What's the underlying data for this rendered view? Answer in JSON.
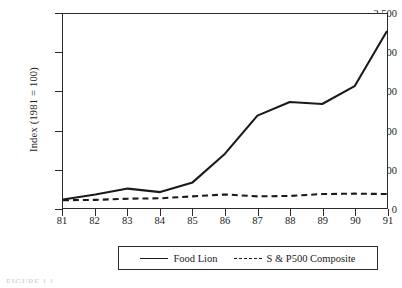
{
  "figure": {
    "caption_partial": "FIGURE 1.1"
  },
  "chart_data": {
    "type": "line",
    "title": "",
    "xlabel": "",
    "ylabel": "Index (1981 = 100)",
    "categories": [
      "81",
      "82",
      "83",
      "84",
      "85",
      "86",
      "87",
      "88",
      "89",
      "90",
      "91"
    ],
    "x": [
      81,
      82,
      83,
      84,
      85,
      86,
      87,
      88,
      89,
      90,
      91
    ],
    "series": [
      {
        "name": "Food Lion",
        "style": "solid",
        "color": "#1a1a1a",
        "values": [
          110,
          175,
          250,
          205,
          330,
          700,
          1190,
          1365,
          1340,
          1570,
          2280
        ]
      },
      {
        "name": "S & P500 Composite",
        "style": "dashed",
        "color": "#1a1a1a",
        "values": [
          100,
          105,
          120,
          125,
          150,
          175,
          150,
          155,
          180,
          185,
          180
        ]
      }
    ],
    "ylim": [
      0,
      2500
    ],
    "yticks": [
      0,
      500,
      1000,
      1500,
      2000,
      2500
    ],
    "ytick_labels": [
      "0",
      "500",
      "1,000",
      "1,500",
      "2,000",
      "2,500"
    ],
    "xlim": [
      81,
      91
    ],
    "grid": false,
    "legend_position": "bottom-center",
    "legend": [
      "Food Lion",
      "S & P500 Composite"
    ]
  }
}
